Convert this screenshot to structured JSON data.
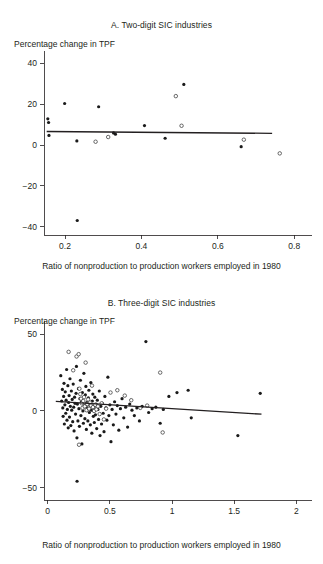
{
  "figure": {
    "xlabel_shared": "Ratio of nonproduction to production workers employed in 1980",
    "ylabel_shared": "Percentage change in TPF"
  },
  "panel_a": {
    "title": "A. Two-digit SIC industries",
    "ylabel": "Percentage change in TPF",
    "xlabel": "Ratio of nonproduction to production workers employed in 1980",
    "yticks": [
      "40",
      "20",
      "0",
      "−20",
      "−40"
    ],
    "xticks": [
      "0.2",
      "0.4",
      "0.6",
      "0.8"
    ]
  },
  "panel_b": {
    "title": "B. Three-digit SIC industries",
    "ylabel": "Percentage change in TPF",
    "xlabel": "Ratio of nonproduction to production workers employed in 1980",
    "yticks": [
      "50",
      "0",
      "−50"
    ],
    "xticks": [
      "0",
      "0.5",
      "1",
      "1.5",
      "2"
    ]
  },
  "chart_data": [
    {
      "type": "scatter",
      "id": "panel-a",
      "title": "A. Two-digit SIC industries",
      "xlabel": "Ratio of nonproduction to production workers employed in 1980",
      "ylabel": "Percentage change in TPF",
      "xlim": [
        0.145,
        0.815
      ],
      "ylim": [
        -44,
        44
      ],
      "xticks": [
        0.2,
        0.4,
        0.6,
        0.8
      ],
      "yticks": [
        -40,
        -20,
        0,
        20,
        40
      ],
      "grid": false,
      "legend": null,
      "series": [
        {
          "name": "filled markers",
          "marker": "filled-circle",
          "points": [
            [
              0.155,
              12.8
            ],
            [
              0.157,
              11.0
            ],
            [
              0.158,
              4.7
            ],
            [
              0.199,
              20.3
            ],
            [
              0.231,
              2.0
            ],
            [
              0.232,
              -36.9
            ],
            [
              0.288,
              18.7
            ],
            [
              0.327,
              5.9
            ],
            [
              0.332,
              5.3
            ],
            [
              0.408,
              9.5
            ],
            [
              0.462,
              3.3
            ],
            [
              0.511,
              29.6
            ],
            [
              0.661,
              -0.8
            ]
          ]
        },
        {
          "name": "open markers",
          "marker": "open-circle",
          "points": [
            [
              0.28,
              1.6
            ],
            [
              0.313,
              3.9
            ],
            [
              0.49,
              23.9
            ],
            [
              0.505,
              9.4
            ],
            [
              0.668,
              2.6
            ],
            [
              0.762,
              -4.1
            ]
          ]
        }
      ],
      "fit_line": {
        "name": "regression line",
        "x": [
          0.152,
          0.742
        ],
        "y": [
          6.6,
          5.7
        ]
      }
    },
    {
      "type": "scatter",
      "id": "panel-b",
      "title": "B. Three-digit SIC industries",
      "xlabel": "Ratio of nonproduction to production workers employed in 1980",
      "ylabel": "Percentage change in TPF",
      "xlim": [
        -0.03,
        2.03
      ],
      "ylim": [
        -58,
        56
      ],
      "xticks": [
        0,
        0.5,
        1,
        1.5,
        2
      ],
      "yticks": [
        -50,
        0,
        50
      ],
      "grid": false,
      "legend": null,
      "series": [
        {
          "name": "filled markers",
          "marker": "filled-circle",
          "points": [
            [
              0.105,
              23.0
            ],
            [
              0.112,
              6.5
            ],
            [
              0.118,
              14.0
            ],
            [
              0.121,
              2.0
            ],
            [
              0.124,
              -3.5
            ],
            [
              0.128,
              9.5
            ],
            [
              0.131,
              18.0
            ],
            [
              0.134,
              -8.5
            ],
            [
              0.138,
              4.0
            ],
            [
              0.141,
              12.5
            ],
            [
              0.145,
              -1.5
            ],
            [
              0.148,
              7.0
            ],
            [
              0.152,
              27.0
            ],
            [
              0.155,
              -6.0
            ],
            [
              0.158,
              1.0
            ],
            [
              0.162,
              16.5
            ],
            [
              0.165,
              -11.0
            ],
            [
              0.168,
              5.5
            ],
            [
              0.172,
              10.0
            ],
            [
              0.175,
              -4.0
            ],
            [
              0.179,
              21.0
            ],
            [
              0.182,
              3.0
            ],
            [
              0.186,
              -9.5
            ],
            [
              0.19,
              13.0
            ],
            [
              0.193,
              0.5
            ],
            [
              0.197,
              7.5
            ],
            [
              0.201,
              -7.0
            ],
            [
              0.205,
              17.5
            ],
            [
              0.209,
              2.5
            ],
            [
              0.212,
              -13.0
            ],
            [
              0.216,
              9.0
            ],
            [
              0.22,
              5.0
            ],
            [
              0.224,
              -2.0
            ],
            [
              0.228,
              11.5
            ],
            [
              0.231,
              29.0
            ],
            [
              0.235,
              -17.5
            ],
            [
              0.239,
              4.5
            ],
            [
              0.236,
              -45.8
            ],
            [
              0.243,
              -6.5
            ],
            [
              0.247,
              14.5
            ],
            [
              0.251,
              1.5
            ],
            [
              0.255,
              -10.0
            ],
            [
              0.259,
              8.0
            ],
            [
              0.263,
              20.0
            ],
            [
              0.267,
              -3.0
            ],
            [
              0.271,
              6.0
            ],
            [
              0.275,
              -21.5
            ],
            [
              0.279,
              12.0
            ],
            [
              0.283,
              0.0
            ],
            [
              0.287,
              -8.0
            ],
            [
              0.291,
              24.5
            ],
            [
              0.295,
              3.5
            ],
            [
              0.299,
              -5.0
            ],
            [
              0.303,
              10.5
            ],
            [
              0.307,
              16.0
            ],
            [
              0.311,
              -12.0
            ],
            [
              0.315,
              5.5
            ],
            [
              0.319,
              2.0
            ],
            [
              0.323,
              -6.5
            ],
            [
              0.327,
              8.5
            ],
            [
              0.331,
              13.5
            ],
            [
              0.335,
              -1.0
            ],
            [
              0.339,
              4.0
            ],
            [
              0.343,
              -9.0
            ],
            [
              0.347,
              18.5
            ],
            [
              0.351,
              0.5
            ],
            [
              0.355,
              -14.5
            ],
            [
              0.359,
              6.5
            ],
            [
              0.363,
              11.0
            ],
            [
              0.367,
              -3.5
            ],
            [
              0.371,
              2.5
            ],
            [
              0.375,
              -7.5
            ],
            [
              0.379,
              9.0
            ],
            [
              0.384,
              -2.5
            ],
            [
              0.389,
              4.5
            ],
            [
              0.394,
              -11.5
            ],
            [
              0.399,
              7.0
            ],
            [
              0.404,
              1.0
            ],
            [
              0.409,
              -5.5
            ],
            [
              0.415,
              13.0
            ],
            [
              0.421,
              -16.0
            ],
            [
              0.427,
              3.0
            ],
            [
              0.433,
              -8.5
            ],
            [
              0.439,
              5.0
            ],
            [
              0.446,
              -1.5
            ],
            [
              0.453,
              -13.5
            ],
            [
              0.46,
              9.5
            ],
            [
              0.468,
              2.0
            ],
            [
              0.476,
              -6.0
            ],
            [
              0.484,
              22.0
            ],
            [
              0.492,
              -3.0
            ],
            [
              0.5,
              4.0
            ],
            [
              0.509,
              -20.0
            ],
            [
              0.518,
              1.0
            ],
            [
              0.528,
              -9.0
            ],
            [
              0.538,
              6.0
            ],
            [
              0.549,
              -2.0
            ],
            [
              0.56,
              3.5
            ],
            [
              0.572,
              -12.5
            ],
            [
              0.585,
              1.5
            ],
            [
              0.598,
              8.0
            ],
            [
              0.612,
              -4.5
            ],
            [
              0.627,
              2.5
            ],
            [
              0.643,
              -10.5
            ],
            [
              0.66,
              4.5
            ],
            [
              0.678,
              0.5
            ],
            [
              0.697,
              -3.0
            ],
            [
              0.717,
              2.0
            ],
            [
              0.738,
              -6.5
            ],
            [
              0.76,
              3.0
            ],
            [
              0.79,
              45.2
            ],
            [
              0.812,
              -1.0
            ],
            [
              0.84,
              1.5
            ],
            [
              0.87,
              2.5
            ],
            [
              0.905,
              -8.0
            ],
            [
              0.93,
              1.0
            ],
            [
              0.975,
              9.5
            ],
            [
              1.04,
              12.0
            ],
            [
              1.13,
              13.5
            ],
            [
              1.155,
              -4.5
            ],
            [
              1.53,
              -16.0
            ],
            [
              1.71,
              11.5
            ]
          ]
        },
        {
          "name": "open markers",
          "marker": "open-circle",
          "points": [
            [
              0.168,
              38.5
            ],
            [
              0.205,
              26.5
            ],
            [
              0.232,
              35.5
            ],
            [
              0.249,
              37.0
            ],
            [
              0.255,
              14.5
            ],
            [
              0.262,
              11.0
            ],
            [
              0.268,
              8.0
            ],
            [
              0.274,
              5.0
            ],
            [
              0.28,
              2.0
            ],
            [
              0.286,
              6.5
            ],
            [
              0.292,
              9.0
            ],
            [
              0.298,
              3.0
            ],
            [
              0.305,
              31.5
            ],
            [
              0.312,
              0.5
            ],
            [
              0.318,
              4.5
            ],
            [
              0.325,
              7.5
            ],
            [
              0.332,
              1.5
            ],
            [
              0.34,
              5.5
            ],
            [
              0.348,
              3.5
            ],
            [
              0.356,
              16.5
            ],
            [
              0.364,
              2.5
            ],
            [
              0.373,
              0.0
            ],
            [
              0.382,
              4.0
            ],
            [
              0.392,
              1.0
            ],
            [
              0.404,
              3.0
            ],
            [
              0.418,
              -2.0
            ],
            [
              0.434,
              5.0
            ],
            [
              0.452,
              -5.5
            ],
            [
              0.47,
              1.5
            ],
            [
              0.505,
              12.0
            ],
            [
              0.56,
              13.5
            ],
            [
              0.62,
              10.0
            ],
            [
              0.672,
              7.0
            ],
            [
              0.745,
              2.0
            ],
            [
              0.8,
              3.5
            ],
            [
              0.905,
              25.0
            ],
            [
              0.925,
              -14.0
            ],
            [
              0.252,
              -22.0
            ]
          ]
        }
      ],
      "fit_line": {
        "name": "regression line",
        "x": [
          0.065,
          1.72
        ],
        "y": [
          6.2,
          -2.1
        ]
      }
    }
  ]
}
